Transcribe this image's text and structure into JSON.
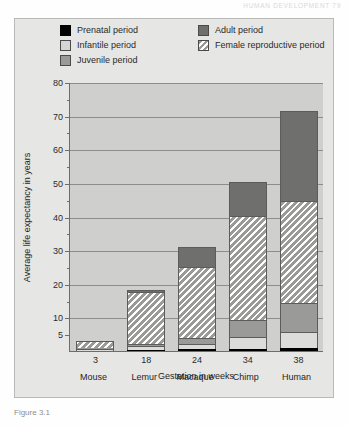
{
  "page": {
    "running_head": "HUMAN DEVELOPMENT   79",
    "caption": "Figure 3.1"
  },
  "legend": {
    "items": [
      {
        "label": "Prenatal period",
        "swatch": "prenatal",
        "color": "#000000",
        "column": 1,
        "row": 0
      },
      {
        "label": "Infantile period",
        "swatch": "infantile",
        "color": "#d5d5d3",
        "column": 1,
        "row": 1
      },
      {
        "label": "Juvenile period",
        "swatch": "juvenile",
        "color": "#9a9a98",
        "column": 1,
        "row": 2
      },
      {
        "label": "Adult period",
        "swatch": "adult",
        "color": "#6f6f6d",
        "column": 2,
        "row": 0
      },
      {
        "label": "Female reproductive period",
        "swatch": "repro",
        "color": "#9a9a98",
        "column": 2,
        "row": 1
      }
    ]
  },
  "chart_data": {
    "type": "bar",
    "title": "",
    "stacked": true,
    "xlabel": "Gestation in weeks",
    "ylabel": "Average life expectancy in years",
    "ylim": [
      0,
      80
    ],
    "yticks": [
      5,
      10,
      20,
      30,
      40,
      50,
      60,
      70,
      80
    ],
    "ytick_labels": [
      "5",
      "10",
      "20",
      "30",
      "40",
      "50",
      "60",
      "70",
      "80"
    ],
    "minor_yticks": [
      15,
      25,
      35,
      45,
      55,
      65,
      75
    ],
    "grid": true,
    "legend_position": "top",
    "categories": [
      "Mouse",
      "Lemur",
      "Macaque",
      "Chimp",
      "Human"
    ],
    "x": [
      3,
      18,
      24,
      34,
      38
    ],
    "xtick_labels": [
      "3",
      "18",
      "24",
      "34",
      "38"
    ],
    "series": [
      {
        "name": "Prenatal period",
        "key": "prenatal",
        "values": [
          0.1,
          0.35,
          0.5,
          0.65,
          0.75
        ]
      },
      {
        "name": "Infantile period",
        "key": "infantile",
        "values": [
          0.4,
          1.0,
          1.5,
          3.5,
          5.0
        ]
      },
      {
        "name": "Juvenile period",
        "key": "juvenile",
        "values": [
          0.3,
          0.8,
          2.0,
          5.0,
          8.5
        ]
      },
      {
        "name": "Female reproductive period",
        "key": "repro",
        "values": [
          2.2,
          15.5,
          21.0,
          31.0,
          30.5
        ]
      },
      {
        "name": "Adult period",
        "key": "adult",
        "values": [
          0.0,
          0.35,
          6.0,
          10.0,
          26.5
        ]
      }
    ],
    "totals": [
      3,
      18,
      31,
      50,
      71
    ]
  }
}
